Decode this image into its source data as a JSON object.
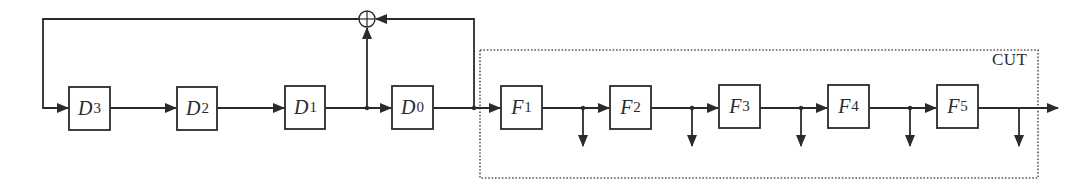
{
  "diagram": {
    "type": "block-diagram",
    "colors": {
      "line": "#2b2b2b",
      "background": "#ffffff",
      "cut_border": "#555555"
    },
    "register_blocks": [
      {
        "id": "D3",
        "base": "D",
        "sub": "3"
      },
      {
        "id": "D2",
        "base": "D",
        "sub": "2"
      },
      {
        "id": "D1",
        "base": "D",
        "sub": "1"
      },
      {
        "id": "D0",
        "base": "D",
        "sub": "0"
      }
    ],
    "cut_blocks": [
      {
        "id": "F1",
        "base": "F",
        "sub": "1"
      },
      {
        "id": "F2",
        "base": "F",
        "sub": "2"
      },
      {
        "id": "F3",
        "base": "F",
        "sub": "3"
      },
      {
        "id": "F4",
        "base": "F",
        "sub": "4"
      },
      {
        "id": "F5",
        "base": "F",
        "sub": "5"
      }
    ],
    "adder": {
      "symbol": "xor",
      "label": "⊕"
    },
    "cut_box": {
      "label": "CUT",
      "style": "dotted"
    },
    "connections": [
      "D3 -> D2",
      "D2 -> D1",
      "D1 -> D0",
      "D0 -> F1",
      "F1 -> F2",
      "F2 -> F3",
      "F3 -> F4",
      "F4 -> F5",
      "F5 -> out",
      "D1.out -> adder",
      "D0.out -> adder",
      "adder -> D3.in",
      "F1.out -> tap",
      "F2.out -> tap",
      "F3.out -> tap",
      "F4.out -> tap",
      "F5.out -> tap"
    ]
  }
}
